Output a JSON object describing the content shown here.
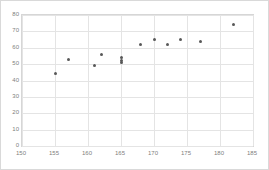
{
  "chart_data": {
    "type": "scatter",
    "title": "",
    "subtitle": "",
    "xlabel": "",
    "ylabel": "",
    "xlim": [
      150,
      185
    ],
    "ylim": [
      0,
      80
    ],
    "xticks": [
      150,
      155,
      160,
      165,
      170,
      175,
      180,
      185
    ],
    "yticks": [
      0,
      10,
      20,
      30,
      40,
      50,
      60,
      70,
      80
    ],
    "grid": true,
    "legend": false,
    "legend_position": "none",
    "marker_color": "#585858",
    "gridline_color": "#e4e4e4",
    "axis_label_color": "#808080",
    "plot_border_color": "#d6d6d6",
    "frame_border_color": "#d9d9d9",
    "background_color": "#ffffff",
    "series": [
      {
        "name": "Series 1",
        "points": [
          {
            "x": 155,
            "y": 44
          },
          {
            "x": 157,
            "y": 53
          },
          {
            "x": 161,
            "y": 49
          },
          {
            "x": 162,
            "y": 56
          },
          {
            "x": 165,
            "y": 51
          },
          {
            "x": 165,
            "y": 52
          },
          {
            "x": 165,
            "y": 54
          },
          {
            "x": 168,
            "y": 62
          },
          {
            "x": 170,
            "y": 65
          },
          {
            "x": 172,
            "y": 62
          },
          {
            "x": 174,
            "y": 65
          },
          {
            "x": 177,
            "y": 64
          },
          {
            "x": 182,
            "y": 74
          }
        ]
      }
    ]
  }
}
